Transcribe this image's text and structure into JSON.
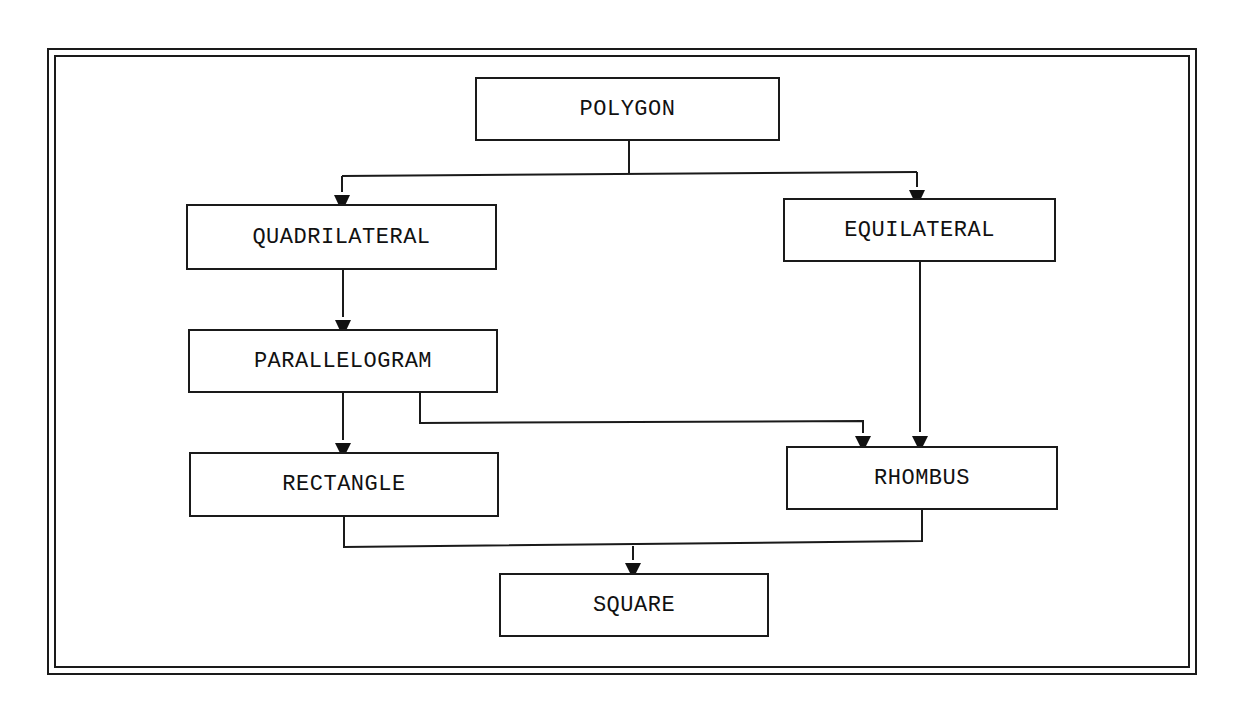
{
  "diagram": {
    "type": "hierarchy-flowchart",
    "colors": {
      "line": "#1a1a1a",
      "text": "#111111",
      "background": "#ffffff"
    },
    "nodes": {
      "polygon": "POLYGON",
      "quadrilateral": "QUADRILATERAL",
      "equilateral": "EQUILATERAL",
      "parallelogram": "PARALLELOGRAM",
      "rectangle": "RECTANGLE",
      "rhombus": "RHOMBUS",
      "square": "SQUARE"
    },
    "edges": [
      {
        "from": "POLYGON",
        "to": "QUADRILATERAL"
      },
      {
        "from": "POLYGON",
        "to": "EQUILATERAL"
      },
      {
        "from": "QUADRILATERAL",
        "to": "PARALLELOGRAM"
      },
      {
        "from": "PARALLELOGRAM",
        "to": "RECTANGLE"
      },
      {
        "from": "PARALLELOGRAM",
        "to": "RHOMBUS"
      },
      {
        "from": "EQUILATERAL",
        "to": "RHOMBUS"
      },
      {
        "from": "RECTANGLE",
        "to": "SQUARE"
      },
      {
        "from": "RHOMBUS",
        "to": "SQUARE"
      }
    ],
    "arrow_icon": "down-triangle-arrow"
  }
}
